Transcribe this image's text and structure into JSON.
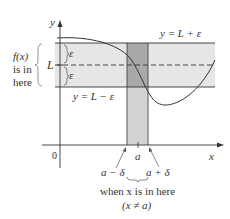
{
  "diagram": {
    "axes": {
      "x_label": "x",
      "y_label": "y",
      "origin_label": "0"
    },
    "band": {
      "upper_label": "y = L + ε",
      "lower_label": "y = L − ε",
      "center_label": "L",
      "epsilon_upper": "ε",
      "epsilon_lower": "ε",
      "brace_text": [
        "f(x)",
        "is in",
        "here"
      ]
    },
    "strip": {
      "center_label": "a",
      "left_label": "a − δ",
      "right_label": "a + δ",
      "caption_line1": "when x is in here",
      "caption_line2": "(x ≠ a)"
    },
    "colors": {
      "band_fill": "#e6e6e6",
      "strip_fill": "#d2d2d2",
      "overlap_fill": "#a9a9a9",
      "line": "#333333"
    }
  }
}
